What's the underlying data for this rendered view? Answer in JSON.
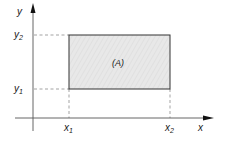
{
  "diagram": {
    "axes": {
      "x_label": "x",
      "y_label": "y"
    },
    "region": {
      "label": "(A)",
      "fill": "#e6e6e6",
      "stroke": "#333333"
    },
    "ticks": {
      "x1": {
        "base": "x",
        "sub": "1"
      },
      "x2": {
        "base": "x",
        "sub": "2"
      },
      "y1": {
        "base": "y",
        "sub": "1"
      },
      "y2": {
        "base": "y",
        "sub": "2"
      }
    },
    "colors": {
      "axis": "#555555",
      "dashed": "#999999",
      "text": "#1a1a1a"
    }
  }
}
